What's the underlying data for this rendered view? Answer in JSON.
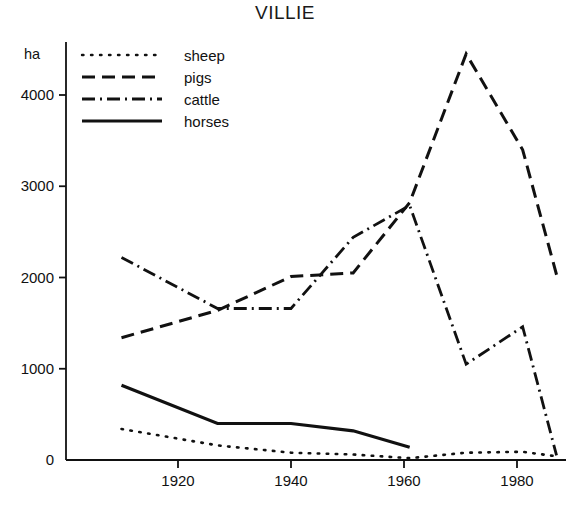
{
  "chart_data": {
    "type": "line",
    "title": "VILLIE",
    "xlabel": "",
    "ylabel": "ha",
    "ylim": [
      0,
      4600
    ],
    "xlim": [
      1905,
      1990
    ],
    "grid": false,
    "legend_position": "top-left",
    "yticks": [
      0,
      1000,
      2000,
      3000,
      4000
    ],
    "ytick_labels": [
      "0",
      "1000",
      "2000",
      "3000",
      "4000"
    ],
    "xticks": [
      1920,
      1940,
      1960,
      1980
    ],
    "xtick_labels": [
      "1920",
      "1940",
      "1960",
      "1980"
    ],
    "series": [
      {
        "name": "sheep",
        "style": "dotted",
        "x": [
          1910,
          1927,
          1940,
          1951,
          1961,
          1971,
          1981,
          1987
        ],
        "values": [
          340,
          160,
          80,
          60,
          20,
          80,
          90,
          40
        ]
      },
      {
        "name": "pigs",
        "style": "dashed",
        "x": [
          1910,
          1927,
          1940,
          1951,
          1961,
          1971,
          1981,
          1987
        ],
        "values": [
          1340,
          1640,
          2010,
          2050,
          2820,
          4450,
          3400,
          2030
        ]
      },
      {
        "name": "cattle",
        "style": "dash-dot",
        "x": [
          1910,
          1927,
          1940,
          1951,
          1961,
          1971,
          1981,
          1987
        ],
        "values": [
          2220,
          1660,
          1660,
          2440,
          2790,
          1050,
          1460,
          50
        ]
      },
      {
        "name": "horses",
        "style": "solid",
        "x": [
          1910,
          1927,
          1940,
          1951,
          1961
        ],
        "values": [
          820,
          400,
          400,
          320,
          140
        ]
      }
    ]
  },
  "legend": {
    "entries": [
      {
        "label": "sheep",
        "style": "dotted"
      },
      {
        "label": "pigs",
        "style": "dashed"
      },
      {
        "label": "cattle",
        "style": "dash-dot"
      },
      {
        "label": "horses",
        "style": "solid"
      }
    ]
  },
  "colors": {
    "ink": "#111111",
    "background": "#ffffff"
  }
}
